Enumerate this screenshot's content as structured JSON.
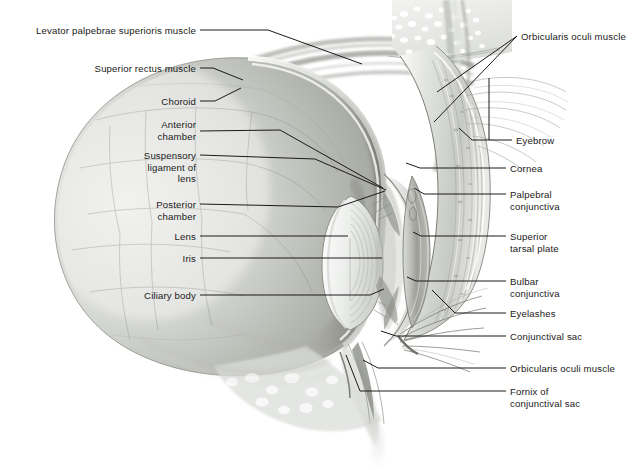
{
  "figure": {
    "background_color": "#ffffff",
    "ink_color": "#1a1a1a",
    "width": 642,
    "height": 470
  },
  "labels_left": [
    {
      "name": "levator-palpebrae-superioris-muscle",
      "lines": [
        "Levator palpebrae superioris muscle"
      ],
      "x_right": 196,
      "y_top": 25,
      "leader": "M200,30 L268,30 L362,64"
    },
    {
      "name": "superior-rectus-muscle",
      "lines": [
        "Superior rectus muscle"
      ],
      "x_right": 196,
      "y_top": 63,
      "leader": "M200,68 L213,68 L243,80"
    },
    {
      "name": "choroid",
      "lines": [
        "Choroid"
      ],
      "x_right": 196,
      "y_top": 96,
      "leader": "M200,101 L215,101 L241,88"
    },
    {
      "name": "anterior-chamber",
      "lines": [
        "Anterior",
        "chamber"
      ],
      "x_right": 196,
      "y_top": 119,
      "leader": "M200,131 L280,130 L383,188"
    },
    {
      "name": "suspensory-ligament-of-lens",
      "lines": [
        "Suspensory",
        "ligament of",
        "lens"
      ],
      "x_right": 196,
      "y_top": 150,
      "leader": "M200,155 L315,159 L386,190"
    },
    {
      "name": "posterior-chamber",
      "lines": [
        "Posterior",
        "chamber"
      ],
      "x_right": 196,
      "y_top": 199,
      "leader": "M200,204 L338,207 L385,191"
    },
    {
      "name": "lens",
      "lines": [
        "Lens"
      ],
      "x_right": 196,
      "y_top": 231,
      "leader": "M200,236 L348,236"
    },
    {
      "name": "iris",
      "lines": [
        "Iris"
      ],
      "x_right": 196,
      "y_top": 253,
      "leader": "M200,258 L382,258"
    },
    {
      "name": "ciliary-body",
      "lines": [
        "Ciliary body"
      ],
      "x_right": 196,
      "y_top": 290,
      "leader": "M200,295 L370,295 L384,289"
    }
  ],
  "labels_right": [
    {
      "name": "orbicularis-oculi-muscle-upper",
      "lines": [
        "Orbicularis oculi muscle"
      ],
      "x_left": 521,
      "y_top": 31,
      "leader": "M517,36 L437,92 M517,36 L434,122"
    },
    {
      "name": "eyebrow",
      "lines": [
        "Eyebrow"
      ],
      "x_left": 516,
      "y_top": 135,
      "leader": "M512,140 L489,140 L489,78 M489,140 L472,140 L459,128"
    },
    {
      "name": "cornea",
      "lines": [
        "Cornea"
      ],
      "x_left": 510,
      "y_top": 163,
      "leader": "M506,168 L420,168 L406,163"
    },
    {
      "name": "palpebral-conjunctiva",
      "lines": [
        "Palpebral",
        "conjunctiva"
      ],
      "x_left": 510,
      "y_top": 189,
      "leader": "M506,194 L424,194 L414,188"
    },
    {
      "name": "superior-tarsal-plate",
      "lines": [
        "Superior",
        "tarsal plate"
      ],
      "x_left": 510,
      "y_top": 231,
      "leader": "M506,236 L421,236 L413,232"
    },
    {
      "name": "bulbar-conjunctiva",
      "lines": [
        "Bulbar",
        "conjunctiva"
      ],
      "x_left": 510,
      "y_top": 276,
      "leader": "M506,281 L416,281 L407,277"
    },
    {
      "name": "eyelashes",
      "lines": [
        "Eyelashes"
      ],
      "x_left": 510,
      "y_top": 308,
      "leader": "M506,313 L455,313 L432,290"
    },
    {
      "name": "conjunctival-sac",
      "lines": [
        "Conjunctival sac"
      ],
      "x_left": 510,
      "y_top": 331,
      "leader": "M506,336 L396,336 L381,331"
    },
    {
      "name": "orbicularis-oculi-muscle-lower",
      "lines": [
        "Orbicularis oculi muscle"
      ],
      "x_left": 510,
      "y_top": 363,
      "leader": "M506,368 L378,368 L363,360"
    },
    {
      "name": "fornix-of-conjunctival-sac",
      "lines": [
        "Fornix of",
        "conjunctival sac"
      ],
      "x_left": 510,
      "y_top": 386,
      "leader": "M506,391 L360,391 L346,355"
    }
  ],
  "anatomy_regions": [
    {
      "name": "eyeball-sclera",
      "tone": "#b7b9b4"
    },
    {
      "name": "choroid-band",
      "tone": "#8e9089"
    },
    {
      "name": "vitreous-body",
      "tone": "#c6c8c3"
    },
    {
      "name": "lens",
      "tone": "#eef0ee"
    },
    {
      "name": "cornea",
      "tone": "#dcdedb"
    },
    {
      "name": "orbital-bone-marrow",
      "tone": "#e6e7e4"
    },
    {
      "name": "eyelid-skin",
      "tone": "#d6d8d4"
    },
    {
      "name": "tarsal-plate",
      "tone": "#a9aba5"
    },
    {
      "name": "orbicularis-oculi-fat",
      "tone": "#cfd1cc"
    }
  ]
}
